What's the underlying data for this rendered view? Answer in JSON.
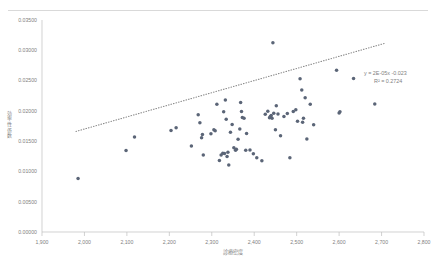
{
  "header": {
    "left_note": "",
    "right_note": ""
  },
  "chart_data": {
    "type": "scatter",
    "title": "",
    "xlabel": "診療密度",
    "ylabel": "効率性係数",
    "xlim": [
      1900,
      2800
    ],
    "ylim": [
      0.0,
      0.035
    ],
    "xticks": [
      "1,900",
      "2,000",
      "2,100",
      "2,200",
      "2,300",
      "2,400",
      "2,500",
      "2,600",
      "2,700",
      "2,800"
    ],
    "xtick_values": [
      1900,
      2000,
      2100,
      2200,
      2300,
      2400,
      2500,
      2600,
      2700,
      2800
    ],
    "yticks": [
      "0.00000",
      "0.00500",
      "0.01000",
      "0.01500",
      "0.02000",
      "0.02500",
      "0.03000",
      "0.03500"
    ],
    "ytick_values": [
      0.0,
      0.005,
      0.01,
      0.015,
      0.02,
      0.025,
      0.03,
      0.035
    ],
    "grid": false,
    "legend": "none",
    "marker_color": "#5b6577",
    "trendline_color": "#8c8c8c",
    "trendline_style": "dotted",
    "annotations": {
      "equation": "y = 2E-05x -0.023",
      "r_squared": "R² = 0.2724"
    },
    "trendline": {
      "slope": 2e-05,
      "intercept": -0.023,
      "x_start": 1980,
      "x_end": 2710
    },
    "points": [
      [
        1985,
        0.00885
      ],
      [
        2098,
        0.01345
      ],
      [
        2118,
        0.0157
      ],
      [
        2204,
        0.01675
      ],
      [
        2216,
        0.0172
      ],
      [
        2252,
        0.0142
      ],
      [
        2268,
        0.01935
      ],
      [
        2272,
        0.01805
      ],
      [
        2276,
        0.01555
      ],
      [
        2278,
        0.0161
      ],
      [
        2280,
        0.0127
      ],
      [
        2298,
        0.0162
      ],
      [
        2305,
        0.0169
      ],
      [
        2308,
        0.0167
      ],
      [
        2312,
        0.0211
      ],
      [
        2318,
        0.0118
      ],
      [
        2322,
        0.0127
      ],
      [
        2326,
        0.013
      ],
      [
        2328,
        0.01985
      ],
      [
        2330,
        0.01295
      ],
      [
        2332,
        0.0218
      ],
      [
        2334,
        0.0186
      ],
      [
        2336,
        0.01245
      ],
      [
        2338,
        0.01315
      ],
      [
        2340,
        0.01105
      ],
      [
        2344,
        0.01645
      ],
      [
        2348,
        0.01775
      ],
      [
        2352,
        0.0139
      ],
      [
        2356,
        0.0135
      ],
      [
        2358,
        0.01365
      ],
      [
        2362,
        0.0153
      ],
      [
        2366,
        0.017
      ],
      [
        2368,
        0.0214
      ],
      [
        2370,
        0.0199
      ],
      [
        2372,
        0.0189
      ],
      [
        2376,
        0.0188
      ],
      [
        2380,
        0.0135
      ],
      [
        2382,
        0.01625
      ],
      [
        2390,
        0.01355
      ],
      [
        2398,
        0.0129
      ],
      [
        2406,
        0.01225
      ],
      [
        2418,
        0.01175
      ],
      [
        2426,
        0.01945
      ],
      [
        2432,
        0.01995
      ],
      [
        2436,
        0.01885
      ],
      [
        2438,
        0.01905
      ],
      [
        2440,
        0.01925
      ],
      [
        2442,
        0.0188
      ],
      [
        2444,
        0.03125
      ],
      [
        2446,
        0.0196
      ],
      [
        2450,
        0.0169
      ],
      [
        2452,
        0.02085
      ],
      [
        2456,
        0.0195
      ],
      [
        2462,
        0.0159
      ],
      [
        2470,
        0.01905
      ],
      [
        2478,
        0.01955
      ],
      [
        2484,
        0.01225
      ],
      [
        2492,
        0.0199
      ],
      [
        2498,
        0.0202
      ],
      [
        2502,
        0.0183
      ],
      [
        2508,
        0.0253
      ],
      [
        2512,
        0.02345
      ],
      [
        2514,
        0.0181
      ],
      [
        2516,
        0.0188
      ],
      [
        2520,
        0.02215
      ],
      [
        2524,
        0.01535
      ],
      [
        2532,
        0.0211
      ],
      [
        2540,
        0.0177
      ],
      [
        2594,
        0.0267
      ],
      [
        2600,
        0.01965
      ],
      [
        2602,
        0.01985
      ],
      [
        2634,
        0.02535
      ],
      [
        2684,
        0.02115
      ]
    ]
  }
}
